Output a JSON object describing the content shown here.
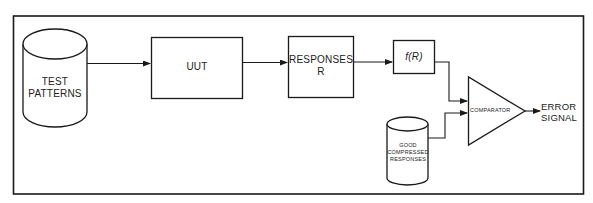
{
  "diagram": {
    "title": "",
    "nodes": {
      "test_patterns": {
        "line1": "TEST",
        "line2": "PATTERNS",
        "shape": "cylinder"
      },
      "uut": {
        "label": "UUT",
        "shape": "rectangle"
      },
      "responses": {
        "line1": "RESPONSES",
        "line2": "R",
        "shape": "rectangle"
      },
      "fr": {
        "label": "f(R)",
        "shape": "rectangle"
      },
      "good_compressed": {
        "line1": "GOOD",
        "line2": "COMPRESSED",
        "line3": "RESPONSES",
        "shape": "cylinder"
      },
      "comparator": {
        "label": "COMPARATOR",
        "shape": "triangle"
      },
      "error_signal": {
        "line1": "ERROR",
        "line2": "SIGNAL",
        "shape": "text"
      }
    },
    "edges": [
      {
        "from": "test_patterns",
        "to": "uut"
      },
      {
        "from": "uut",
        "to": "responses"
      },
      {
        "from": "responses",
        "to": "fr"
      },
      {
        "from": "fr",
        "to": "comparator"
      },
      {
        "from": "good_compressed",
        "to": "comparator"
      },
      {
        "from": "comparator",
        "to": "error_signal"
      }
    ],
    "colors": {
      "stroke": "#1a1a1a",
      "background": "#ffffff"
    }
  }
}
